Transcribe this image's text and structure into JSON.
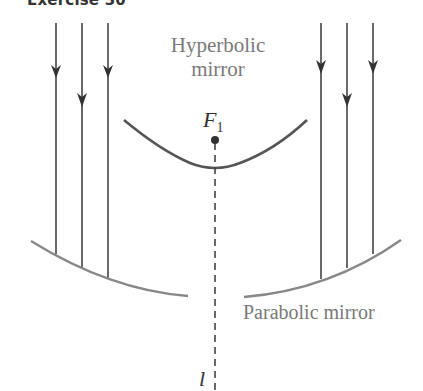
{
  "title": "Exercise 30",
  "labels": {
    "hyperbolic_mirror": "Hyperbolic mirror",
    "parabolic_mirror": "Parabolic mirror",
    "focus": "F",
    "focus_subscript": "1",
    "axis": "l"
  },
  "colors": {
    "rays": "#444444",
    "mirror_hyperbolic": "#555555",
    "mirror_parabolic": "#888888",
    "label_gray": "#7a7a7a",
    "dark_text": "#333333"
  },
  "diagram": {
    "left_rays_x": [
      56,
      82,
      108
    ],
    "right_rays_x": [
      321,
      347,
      373
    ],
    "axis_x": 215,
    "focus_y": 140,
    "hyperbola_vertex_y": 170
  }
}
